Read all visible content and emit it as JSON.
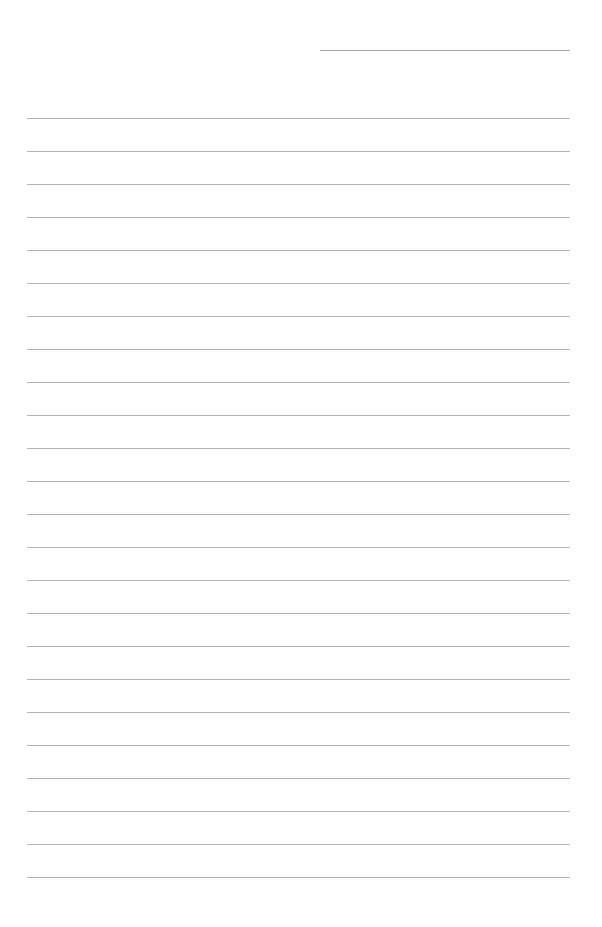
{
  "page": {
    "type": "lined-paper",
    "header_line": "name-date-field",
    "rule_count": 24,
    "rule_color": "#b3b3b3",
    "text_content": ""
  }
}
